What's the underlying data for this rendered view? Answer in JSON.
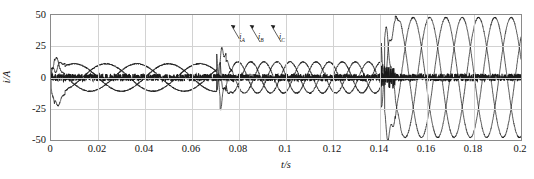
{
  "chart_data": {
    "type": "line",
    "title": "",
    "xlabel": "t/s",
    "ylabel": "i/A",
    "xlim": [
      0,
      0.2
    ],
    "ylim": [
      -50,
      50
    ],
    "xticks": [
      "0",
      "0.02",
      "0.04",
      "0.06",
      "0.08",
      "0.1",
      "0.12",
      "0.14",
      "0.16",
      "0.18",
      "0.2"
    ],
    "xtick_values": [
      0,
      0.02,
      0.04,
      0.06,
      0.08,
      0.1,
      0.12,
      0.14,
      0.16,
      0.18,
      0.2
    ],
    "yticks": [
      "50",
      "25",
      "0",
      "-25",
      "-50"
    ],
    "ytick_values": [
      50,
      25,
      0,
      -25,
      -50
    ],
    "grid": true,
    "legend_position": "inline-annotations",
    "series": [
      {
        "name": "i_A",
        "label": "i",
        "subscript": "A",
        "color": "#1a1a1a",
        "description": "Phase A current: start-up transient peaking near +25 A at t=0.002 s, then low-amplitude ~10 A beating oscillation until 0.072 s, a switching transient at 0.072 s, medium-amplitude ~12 A oscillation 0.074-0.142 s, a second transient at 0.142 s peaking near +44 A, then steady ~48 A sinusoid to 0.2 s"
      },
      {
        "name": "i_B",
        "label": "i",
        "subscript": "B",
        "color": "#1a1a1a",
        "description": "Phase B current: same envelope as phase A, shifted 120 degrees"
      },
      {
        "name": "i_C",
        "label": "i",
        "subscript": "C",
        "color": "#1a1a1a",
        "description": "Phase C current: same envelope as phase A, shifted 240 degrees"
      }
    ],
    "annotations": [
      {
        "text": "i",
        "subscript": "A",
        "x": 0.0805,
        "y": 30
      },
      {
        "text": "i",
        "subscript": "B",
        "x": 0.0885,
        "y": 30
      },
      {
        "text": "i",
        "subscript": "C",
        "x": 0.0975,
        "y": 30
      }
    ],
    "events": [
      {
        "t": 0.0,
        "kind": "startup-transient"
      },
      {
        "t": 0.072,
        "kind": "switching-transient"
      },
      {
        "t": 0.142,
        "kind": "switching-transient"
      }
    ],
    "noise_band": {
      "center": 0,
      "half_width": 3,
      "description": "dense dark noise band along the zero line across the full time axis"
    }
  },
  "colors": {
    "axis": "#8a8a8a",
    "grid": "#d2d2d2",
    "trace": "#1a1a1a",
    "background": "#ffffff"
  }
}
